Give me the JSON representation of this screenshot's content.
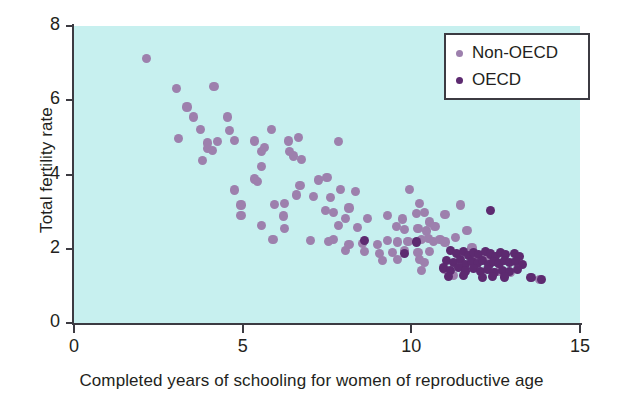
{
  "chart_data": {
    "type": "scatter",
    "title": "",
    "xlabel": "Completed years of schooling for women of reproductive age",
    "ylabel": "Total fertility rate",
    "xlim": [
      0,
      15
    ],
    "ylim": [
      0,
      8
    ],
    "xticks": [
      "0",
      "5",
      "10",
      "15"
    ],
    "xtick_values": [
      0,
      5,
      10,
      15
    ],
    "yticks": [
      "0",
      "2",
      "4",
      "6",
      "8"
    ],
    "ytick_values": [
      0,
      2,
      4,
      6,
      8
    ],
    "grid": false,
    "legend_position": "top-right",
    "colors": {
      "background": "#c7f0ef",
      "non_oecd": "#9d80ad",
      "oecd": "#5d2a70",
      "axis": "#3c3b42",
      "text": "#231f20",
      "page": "#ffffff"
    },
    "series": [
      {
        "name": "Non-OECD",
        "color": "#9d80ad",
        "points": [
          [
            2.15,
            7.12
          ],
          [
            3.05,
            6.32
          ],
          [
            4.15,
            6.37
          ],
          [
            3.35,
            5.82
          ],
          [
            3.55,
            5.55
          ],
          [
            4.55,
            5.55
          ],
          [
            3.75,
            5.22
          ],
          [
            4.6,
            5.18
          ],
          [
            5.85,
            5.22
          ],
          [
            3.1,
            4.98
          ],
          [
            3.95,
            4.85
          ],
          [
            4.25,
            4.88
          ],
          [
            4.75,
            4.92
          ],
          [
            5.35,
            4.9
          ],
          [
            6.35,
            4.9
          ],
          [
            6.65,
            5.0
          ],
          [
            3.95,
            4.7
          ],
          [
            4.1,
            4.65
          ],
          [
            5.55,
            4.62
          ],
          [
            5.65,
            4.72
          ],
          [
            6.4,
            4.62
          ],
          [
            7.85,
            4.88
          ],
          [
            3.8,
            4.38
          ],
          [
            5.55,
            4.22
          ],
          [
            6.5,
            4.5
          ],
          [
            6.75,
            4.4
          ],
          [
            5.35,
            3.88
          ],
          [
            5.45,
            3.82
          ],
          [
            6.7,
            3.7
          ],
          [
            7.25,
            3.85
          ],
          [
            7.5,
            3.92
          ],
          [
            7.9,
            3.6
          ],
          [
            4.75,
            3.58
          ],
          [
            6.6,
            3.45
          ],
          [
            7.1,
            3.4
          ],
          [
            7.6,
            3.38
          ],
          [
            8.35,
            3.55
          ],
          [
            9.95,
            3.6
          ],
          [
            4.95,
            3.18
          ],
          [
            5.95,
            3.2
          ],
          [
            6.25,
            3.22
          ],
          [
            7.45,
            3.02
          ],
          [
            7.7,
            2.98
          ],
          [
            8.15,
            3.1
          ],
          [
            10.25,
            3.22
          ],
          [
            11.45,
            3.18
          ],
          [
            4.95,
            2.9
          ],
          [
            6.2,
            2.88
          ],
          [
            8.05,
            2.82
          ],
          [
            8.7,
            2.82
          ],
          [
            9.3,
            2.9
          ],
          [
            9.75,
            2.8
          ],
          [
            10.15,
            2.95
          ],
          [
            10.4,
            2.98
          ],
          [
            10.55,
            2.72
          ],
          [
            11.0,
            2.92
          ],
          [
            5.55,
            2.62
          ],
          [
            6.25,
            2.55
          ],
          [
            7.85,
            2.62
          ],
          [
            8.4,
            2.58
          ],
          [
            9.55,
            2.6
          ],
          [
            9.8,
            2.52
          ],
          [
            10.2,
            2.55
          ],
          [
            10.45,
            2.48
          ],
          [
            10.7,
            2.6
          ],
          [
            11.65,
            2.5
          ],
          [
            5.9,
            2.25
          ],
          [
            7.0,
            2.22
          ],
          [
            7.55,
            2.2
          ],
          [
            7.7,
            2.25
          ],
          [
            8.15,
            2.12
          ],
          [
            8.55,
            2.15
          ],
          [
            9.0,
            2.12
          ],
          [
            9.3,
            2.22
          ],
          [
            9.6,
            2.18
          ],
          [
            9.9,
            2.2
          ],
          [
            10.3,
            2.25
          ],
          [
            10.5,
            2.28
          ],
          [
            10.65,
            2.2
          ],
          [
            10.85,
            2.25
          ],
          [
            11.0,
            2.18
          ],
          [
            11.3,
            2.3
          ],
          [
            8.05,
            1.95
          ],
          [
            8.6,
            1.92
          ],
          [
            9.05,
            1.88
          ],
          [
            9.45,
            1.9
          ],
          [
            9.8,
            1.95
          ],
          [
            10.2,
            1.9
          ],
          [
            10.55,
            1.92
          ],
          [
            11.8,
            2.02
          ],
          [
            9.15,
            1.68
          ],
          [
            9.6,
            1.72
          ],
          [
            10.25,
            1.7
          ],
          [
            10.4,
            1.62
          ],
          [
            11.9,
            1.82
          ],
          [
            12.25,
            1.8
          ],
          [
            10.3,
            1.42
          ],
          [
            11.0,
            1.45
          ],
          [
            11.25,
            1.28
          ],
          [
            12.6,
            1.38
          ],
          [
            12.95,
            1.35
          ],
          [
            13.8,
            1.18
          ]
        ]
      },
      {
        "name": "OECD",
        "color": "#5d2a70",
        "points": [
          [
            12.35,
            3.02
          ],
          [
            8.6,
            2.22
          ],
          [
            10.15,
            2.18
          ],
          [
            9.8,
            1.88
          ],
          [
            11.15,
            1.95
          ],
          [
            11.35,
            1.88
          ],
          [
            11.55,
            1.92
          ],
          [
            11.7,
            1.82
          ],
          [
            11.85,
            1.9
          ],
          [
            12.0,
            1.85
          ],
          [
            12.2,
            1.92
          ],
          [
            12.35,
            1.86
          ],
          [
            12.5,
            1.8
          ],
          [
            12.65,
            1.9
          ],
          [
            12.8,
            1.84
          ],
          [
            13.05,
            1.88
          ],
          [
            13.2,
            1.8
          ],
          [
            11.05,
            1.68
          ],
          [
            11.25,
            1.62
          ],
          [
            11.45,
            1.7
          ],
          [
            11.6,
            1.58
          ],
          [
            11.8,
            1.66
          ],
          [
            11.95,
            1.6
          ],
          [
            12.1,
            1.68
          ],
          [
            12.3,
            1.58
          ],
          [
            12.45,
            1.65
          ],
          [
            12.6,
            1.6
          ],
          [
            12.75,
            1.68
          ],
          [
            12.9,
            1.62
          ],
          [
            13.1,
            1.66
          ],
          [
            13.3,
            1.58
          ],
          [
            10.95,
            1.48
          ],
          [
            11.15,
            1.42
          ],
          [
            11.4,
            1.5
          ],
          [
            11.6,
            1.4
          ],
          [
            11.85,
            1.46
          ],
          [
            12.05,
            1.38
          ],
          [
            12.25,
            1.44
          ],
          [
            12.45,
            1.36
          ],
          [
            12.7,
            1.42
          ],
          [
            12.9,
            1.38
          ],
          [
            13.15,
            1.44
          ],
          [
            11.1,
            1.25
          ],
          [
            11.55,
            1.28
          ],
          [
            12.1,
            1.22
          ],
          [
            12.4,
            1.26
          ],
          [
            12.75,
            1.24
          ],
          [
            13.55,
            1.22
          ],
          [
            13.85,
            1.18
          ]
        ]
      }
    ]
  },
  "legend": {
    "items": [
      {
        "label": "Non-OECD",
        "series": "Non-OECD"
      },
      {
        "label": "OECD",
        "series": "OECD"
      }
    ]
  }
}
